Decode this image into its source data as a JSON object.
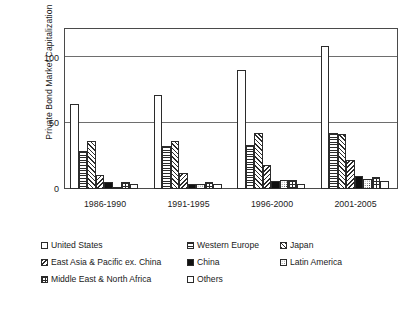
{
  "chart_data": {
    "type": "bar",
    "title": "",
    "subtitle": "",
    "xlabel": "",
    "ylabel": "Private Bond Market Capitalization\n(Percentage of GDP)",
    "categories": [
      "1986-1990",
      "1991-1995",
      "1996-2000",
      "2001-2005"
    ],
    "ylim": [
      0,
      123
    ],
    "yticks": [
      "0",
      "50",
      "100"
    ],
    "ytick_values": [
      0,
      50,
      100
    ],
    "grid": "horizontal",
    "legend_position": "bottom",
    "series": [
      {
        "name": "United States",
        "pattern": "solid-white",
        "values": [
          65,
          72,
          91,
          109
        ]
      },
      {
        "name": "Western Europe",
        "pattern": "hlines",
        "values": [
          29,
          33,
          34,
          43
        ]
      },
      {
        "name": "Japan",
        "pattern": "diag-up",
        "values": [
          37,
          37,
          43,
          42
        ]
      },
      {
        "name": "East Asia & Pacific ex. China",
        "pattern": "diag-down",
        "values": [
          11,
          12,
          18,
          22
        ]
      },
      {
        "name": "China",
        "pattern": "solid-black",
        "values": [
          5,
          4,
          6,
          10
        ]
      },
      {
        "name": "Latin America",
        "pattern": "dots",
        "values": [
          1,
          4,
          7,
          8
        ]
      },
      {
        "name": "Middle East & North Africa",
        "pattern": "grid",
        "values": [
          5,
          5,
          7,
          9
        ]
      },
      {
        "name": "Others",
        "pattern": "lightdots",
        "values": [
          4,
          4,
          4,
          6
        ]
      }
    ],
    "colors": {
      "line": "#2b2b2b",
      "grid": "#6e6e6e",
      "frame": "#4a4a4a",
      "fill_black": "#111111",
      "fill_white": "#ffffff",
      "text": "#1a1a1a",
      "background": "#ffffff"
    }
  },
  "axis": {
    "y_title_line1": "Private Bond Market Capitalization",
    "y_title_line2": "(Percentage of GDP)",
    "ytick_0": "0",
    "ytick_50": "50",
    "ytick_100": "100"
  },
  "legend": {
    "rows": [
      [
        {
          "label": "United States",
          "pattern": "solid-white"
        },
        {
          "label": "Western Europe",
          "pattern": "hlines"
        },
        {
          "label": "Japan",
          "pattern": "diag-up"
        }
      ],
      [
        {
          "label": "East Asia & Pacific ex. China",
          "pattern": "diag-down"
        },
        {
          "label": "China",
          "pattern": "solid-black"
        },
        {
          "label": "Latin America",
          "pattern": "dots"
        }
      ],
      [
        {
          "label": "Middle East & North Africa",
          "pattern": "grid"
        },
        {
          "label": "Others",
          "pattern": "lightdots"
        }
      ]
    ]
  }
}
